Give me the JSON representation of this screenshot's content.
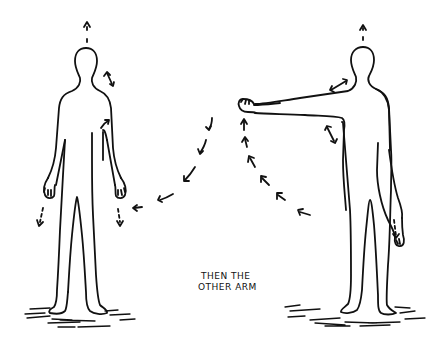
{
  "illustration": {
    "caption": {
      "line1": "THEN THE",
      "line2": "OTHER ARM"
    },
    "figures": [
      {
        "name": "standing-figure-arms-down",
        "pose": "arms at sides"
      },
      {
        "name": "standing-figure-arm-raised",
        "pose": "right arm extended sideways"
      }
    ],
    "colors": {
      "ink": "#111111",
      "background": "#ffffff"
    }
  }
}
